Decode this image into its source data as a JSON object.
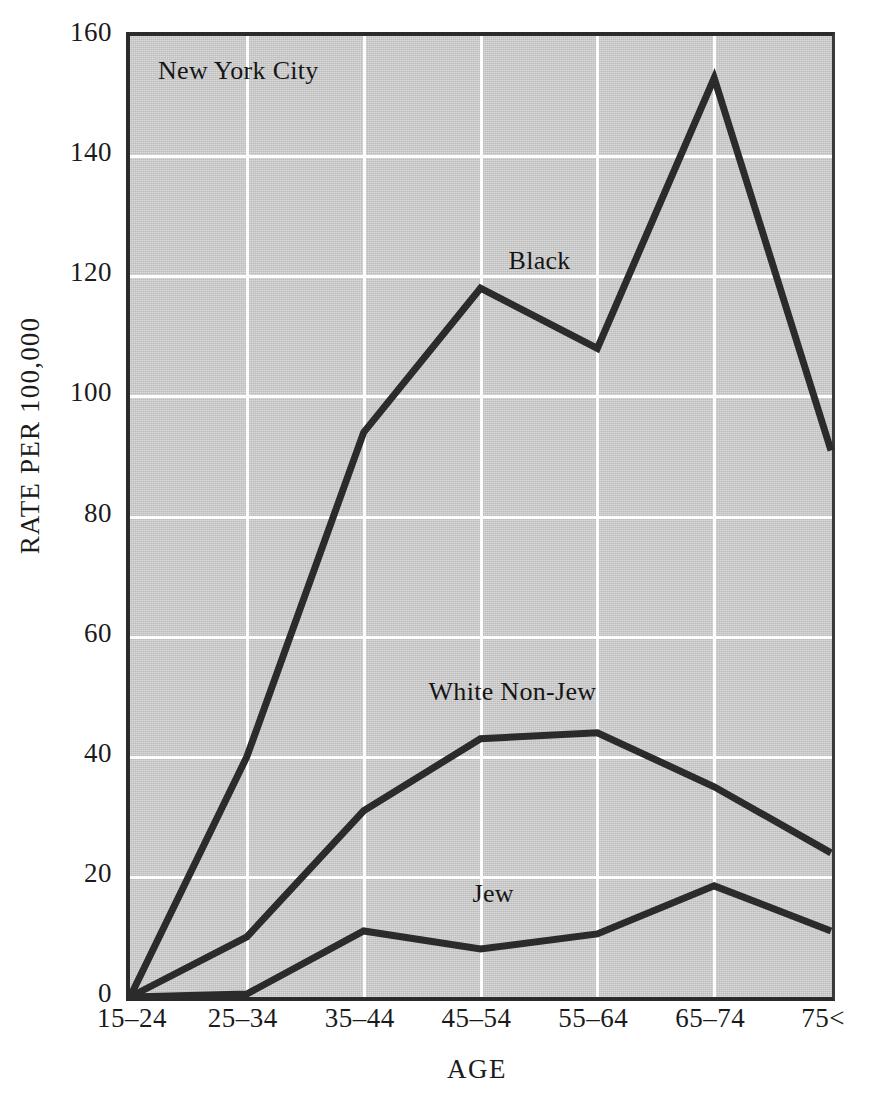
{
  "figure": {
    "note": "New York City",
    "background_color": "#c9c9c9",
    "gridline_color": "#fdfdfd",
    "line_color": "#2b2b2b",
    "axis_color": "#2b2b2b"
  },
  "chart_data": {
    "type": "line",
    "title": "",
    "subtitle": "",
    "annotation_note": "New York City",
    "xlabel": "AGE",
    "ylabel": "RATE PER 100,000",
    "categories": [
      "15–24",
      "25–34",
      "35–44",
      "45–54",
      "55–64",
      "65–74",
      "75<"
    ],
    "xtick_labels": [
      "15–24",
      "25–34",
      "35–44",
      "45–54",
      "55–64",
      "65–74",
      "75<"
    ],
    "ytick_labels": [
      "0",
      "20",
      "40",
      "60",
      "80",
      "100",
      "120",
      "140",
      "160"
    ],
    "ytick_values": [
      0,
      20,
      40,
      60,
      80,
      100,
      120,
      140,
      160
    ],
    "ylim": [
      0,
      160
    ],
    "grid": true,
    "legend": "inline-annotations",
    "series": [
      {
        "name": "Black",
        "label_x_category": "45–54",
        "values": [
          0,
          40,
          94,
          118,
          108,
          153,
          91
        ]
      },
      {
        "name": "White Non-Jew",
        "label_x_category": "45–54",
        "values": [
          0,
          10,
          31,
          43,
          44,
          35,
          24
        ]
      },
      {
        "name": "Jew",
        "label_x_category": "45–54",
        "values": [
          0,
          0.5,
          11,
          8,
          10.5,
          18.5,
          11
        ]
      }
    ]
  },
  "annotations": {
    "black_label": "Black",
    "white_nonjew_label": "White Non-Jew",
    "jew_label": "Jew"
  }
}
